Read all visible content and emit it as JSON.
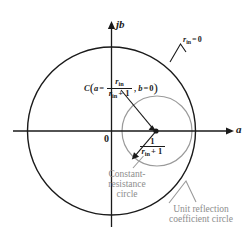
{
  "figure": {
    "axes": {
      "imaginary_label": "jb",
      "real_label": "a",
      "origin_label": "0"
    },
    "annotations": {
      "outer_circle_value": {
        "symbol": "r",
        "subscript": "in",
        "operator": "=",
        "value": "0"
      },
      "center_point": {
        "name": "C",
        "open_paren": "(",
        "coord_a_symbol": "a",
        "coord_a_operator": "=",
        "numerator": "r",
        "numerator_sub": "in",
        "denominator": "r",
        "denominator_sub": "in",
        "denominator_tail": "+ 1",
        "separator": ",",
        "coord_b_symbol": "b",
        "coord_b_operator": "=",
        "coord_b_value": "0",
        "close_paren": ")"
      },
      "radius": {
        "numerator": "1",
        "denominator": "r",
        "denominator_sub": "in",
        "denominator_tail": "+ 1"
      },
      "constant_resistance_caption": "Constant-resistance circle",
      "unit_circle_caption": "Unit reflection coefficient circle"
    },
    "colors": {
      "stroke_dark": "#1a1a1a",
      "stroke_gray": "#9a9a9a",
      "caption_gray": "#8d8d8d",
      "background": "#ffffff"
    },
    "geometry": {
      "unit_circle": {
        "cx": 111.5,
        "cy": 131,
        "r": 84
      },
      "constant_resistance_circle": {
        "cx": 157,
        "cy": 131,
        "r": 35
      },
      "center_dot": {
        "x": 156,
        "y": 131
      }
    }
  }
}
